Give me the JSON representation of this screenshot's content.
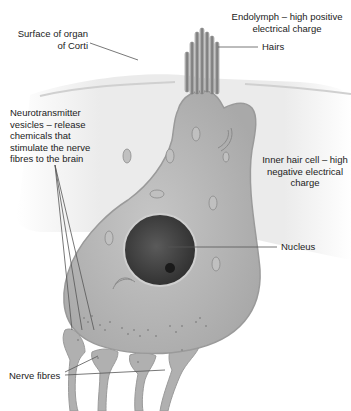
{
  "labels": {
    "surface": [
      "Surface of organ",
      "of Corti"
    ],
    "endolymph": [
      "Endolymph – high positive",
      "electrical charge"
    ],
    "hairs": "Hairs",
    "vesicles": [
      "Neurotransmitter",
      "vesicles – release",
      "chemicals that",
      "stimulate the nerve",
      "fibres to the brain"
    ],
    "inner_hair_cell": [
      "Inner hair cell – high",
      "negative electrical",
      "charge"
    ],
    "nucleus": "Nucleus",
    "nerve_fibres": "Nerve fibres"
  },
  "colors": {
    "cell_fill": "#b8b8b8",
    "cell_edge": "#9a9a9a",
    "nucleus": "#4a4a4a",
    "tissue": "#e4e4e4",
    "leader_line": "#555555",
    "text": "#222222"
  }
}
